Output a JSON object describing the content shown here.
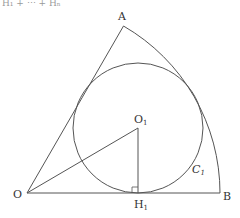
{
  "header_fragment": "H₁ + ⋯ + Hₙ",
  "diagram": {
    "stroke_color": "#555555",
    "points": {
      "O": {
        "label": "O",
        "x": 27,
        "y": 193
      },
      "A": {
        "label": "A",
        "x": 123.5,
        "y": 26
      },
      "B": {
        "label": "B",
        "x": 220,
        "y": 193
      },
      "O1": {
        "label": "O",
        "sub": "1",
        "x": 138,
        "y": 128
      },
      "H1": {
        "label": "H",
        "sub": "1",
        "x": 138,
        "y": 193
      }
    },
    "sector": {
      "center": "O",
      "radius": 193,
      "angle_deg": 60
    },
    "incircle": {
      "label": "C",
      "sub": "1",
      "cx": 138,
      "cy": 128,
      "r": 65
    },
    "segments": [
      "OA",
      "OB",
      "OO1",
      "O1H1"
    ],
    "right_angle_at": "H1"
  }
}
